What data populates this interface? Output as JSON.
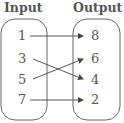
{
  "diagram": {
    "type": "mapping",
    "input_heading": "Input",
    "output_heading": "Output",
    "inputs": [
      "1",
      "3",
      "5",
      "7"
    ],
    "outputs": [
      "8",
      "6",
      "4",
      "2"
    ],
    "mappings": [
      {
        "from": "1",
        "to": "8"
      },
      {
        "from": "3",
        "to": "4"
      },
      {
        "from": "5",
        "to": "6"
      },
      {
        "from": "7",
        "to": "2"
      }
    ],
    "colors": {
      "text": "#555555",
      "lines": "#555555"
    }
  }
}
